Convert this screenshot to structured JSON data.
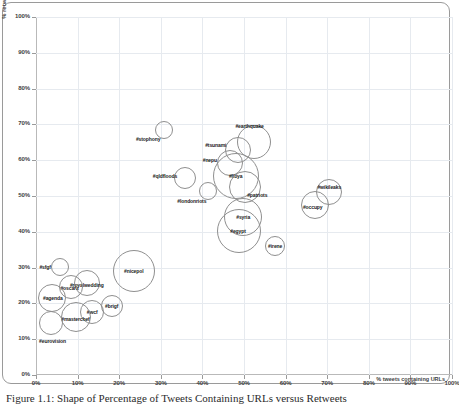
{
  "figure": {
    "caption": "Figure 1.1: Shape of Percentage of Tweets Containing URLs versus Retweets"
  },
  "chart_data": {
    "type": "scatter",
    "title": "",
    "xlabel": "% tweets containing URLs",
    "ylabel": "% retweets",
    "xlim": [
      0,
      100
    ],
    "ylim": [
      0,
      100
    ],
    "grid": true,
    "legend": "none",
    "xticks": [
      "0%",
      "10%",
      "20%",
      "30%",
      "40%",
      "50%",
      "60%",
      "70%",
      "80%",
      "90%",
      "100%"
    ],
    "yticks": [
      "0%",
      "10%",
      "20%",
      "30%",
      "40%",
      "50%",
      "60%",
      "70%",
      "80%",
      "90%",
      "100%"
    ],
    "xtick_values": [
      0,
      10,
      20,
      30,
      40,
      50,
      60,
      70,
      80,
      90,
      100
    ],
    "ytick_values": [
      0,
      10,
      20,
      30,
      40,
      50,
      60,
      70,
      80,
      90,
      100
    ],
    "points": [
      {
        "label": "#stophony",
        "x": 30.8,
        "y": 68.3,
        "size": 9,
        "label_dx": -16,
        "label_dy": 9
      },
      {
        "label": "#earthquake",
        "x": 52.3,
        "y": 65.2,
        "size": 17,
        "label_dx": -4,
        "label_dy": -16
      },
      {
        "label": "#tsunami",
        "x": 48.5,
        "y": 62.8,
        "size": 13,
        "label_dx": -22,
        "label_dy": -5
      },
      {
        "label": "#nepu",
        "x": 46.6,
        "y": 59.2,
        "size": 13,
        "label_dx": -20,
        "label_dy": -3
      },
      {
        "label": "#libya",
        "x": 48.0,
        "y": 55.6,
        "size": 23,
        "label_dx": 0,
        "label_dy": 0
      },
      {
        "label": "#qldfloods",
        "x": 35.8,
        "y": 55.0,
        "size": 11,
        "label_dx": -20,
        "label_dy": -2
      },
      {
        "label": "#patriots",
        "x": 50.3,
        "y": 52.6,
        "size": 16,
        "label_dx": 12,
        "label_dy": 8
      },
      {
        "label": "#wikileaks",
        "x": 70.5,
        "y": 51.0,
        "size": 13,
        "label_dx": 0,
        "label_dy": -5
      },
      {
        "label": "#londonriots",
        "x": 41.3,
        "y": 51.4,
        "size": 9,
        "label_dx": -16,
        "label_dy": 10
      },
      {
        "label": "#occupy",
        "x": 67.0,
        "y": 47.6,
        "size": 14,
        "label_dx": -2,
        "label_dy": 2
      },
      {
        "label": "#syria",
        "x": 49.8,
        "y": 44.2,
        "size": 19,
        "label_dx": 0,
        "label_dy": 0
      },
      {
        "label": "#egypt",
        "x": 48.8,
        "y": 40.2,
        "size": 22,
        "label_dx": -1,
        "label_dy": 0
      },
      {
        "label": "#irene",
        "x": 57.5,
        "y": 36.0,
        "size": 10,
        "label_dx": 0,
        "label_dy": 0
      },
      {
        "label": "#nicepol",
        "x": 23.5,
        "y": 29.0,
        "size": 21,
        "label_dx": 0,
        "label_dy": 0
      },
      {
        "label": "#sfgf",
        "x": 5.8,
        "y": 30.2,
        "size": 9,
        "label_dx": -15,
        "label_dy": 0
      },
      {
        "label": "#royalwedding",
        "x": 12.2,
        "y": 25.8,
        "size": 13,
        "label_dx": 0,
        "label_dy": 2
      },
      {
        "label": "#oscars",
        "x": 8.3,
        "y": 24.5,
        "size": 12,
        "label_dx": -1,
        "label_dy": 1
      },
      {
        "label": "#agenda",
        "x": 3.8,
        "y": 21.5,
        "size": 14,
        "label_dx": 1,
        "label_dy": 0
      },
      {
        "label": "#brigf",
        "x": 18.2,
        "y": 19.2,
        "size": 11,
        "label_dx": 0,
        "label_dy": 0
      },
      {
        "label": "#wcf",
        "x": 13.5,
        "y": 17.5,
        "size": 12,
        "label_dx": 0,
        "label_dy": 0
      },
      {
        "label": "#masterchef",
        "x": 9.5,
        "y": 16.3,
        "size": 15,
        "label_dx": 0,
        "label_dy": 2
      },
      {
        "label": "#eurovision",
        "x": 3.5,
        "y": 14.5,
        "size": 12,
        "label_dx": 2,
        "label_dy": 18
      }
    ]
  }
}
